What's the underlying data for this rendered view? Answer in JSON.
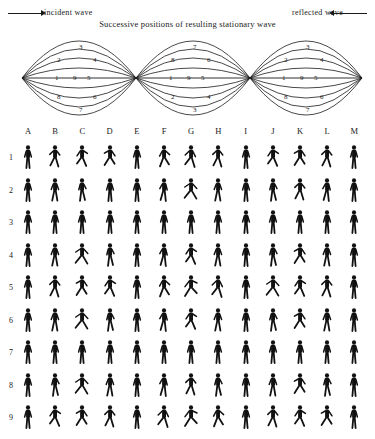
{
  "header": {
    "incident_label": "incident wave",
    "reflected_label": "reflected wave",
    "caption": "Successive positions of resulting stationary wave"
  },
  "wave_diagram": {
    "nodes_x": [
      22,
      136,
      250,
      362
    ],
    "axis_y": 48,
    "lobes": [
      {
        "index": 0,
        "orientation": "up",
        "labels": {
          "top": "3",
          "upper_left": "2",
          "upper_right": "4",
          "mid_left": "1",
          "mid_center": "9",
          "mid_right": "5",
          "lower_left": "8",
          "lower_right": "6",
          "bottom": "7"
        }
      },
      {
        "index": 1,
        "orientation": "down",
        "labels": {
          "top": "7",
          "upper_left": "8",
          "upper_right": "6",
          "mid_left": "1",
          "mid_center": "9",
          "mid_right": "5",
          "lower_left": "2",
          "lower_right": "4",
          "bottom": "3"
        }
      },
      {
        "index": 2,
        "orientation": "up",
        "labels": {
          "top": "3",
          "upper_left": "2",
          "upper_right": "4",
          "mid_left": "1",
          "mid_center": "9",
          "mid_right": "5",
          "lower_left": "8",
          "lower_right": "6",
          "bottom": "7"
        }
      }
    ]
  },
  "grid": {
    "column_labels": [
      "A",
      "B",
      "C",
      "D",
      "E",
      "F",
      "G",
      "H",
      "I",
      "J",
      "K",
      "L",
      "M"
    ],
    "row_labels": [
      "1",
      "2",
      "3",
      "4",
      "5",
      "6",
      "7",
      "8",
      "9"
    ],
    "figure_icon": "running-figure-icon",
    "poses": [
      [
        "stand",
        "run-a",
        "run-b",
        "run-c",
        "stand",
        "run-d",
        "run-e",
        "run-a",
        "stand",
        "run-b",
        "run-c",
        "run-a",
        "stand"
      ],
      [
        "stand",
        "walk-a",
        "walk-b",
        "stand",
        "stand",
        "walk-c",
        "run-f",
        "walk-a",
        "stand",
        "walk-b",
        "run-a",
        "walk-c",
        "stand"
      ],
      [
        "stand",
        "stand",
        "stand",
        "stand",
        "stand",
        "stand",
        "stand",
        "stand",
        "stand",
        "stand",
        "stand",
        "stand",
        "stand"
      ],
      [
        "stand",
        "walk-a",
        "run-f",
        "walk-b",
        "stand",
        "walk-c",
        "run-b",
        "walk-a",
        "stand",
        "walk-b",
        "run-c",
        "walk-a",
        "stand"
      ],
      [
        "stand",
        "run-a",
        "run-c",
        "run-b",
        "stand",
        "run-d",
        "run-g",
        "run-e",
        "stand",
        "run-f",
        "run-b",
        "run-a",
        "stand"
      ],
      [
        "stand",
        "walk-a",
        "run-f",
        "walk-b",
        "stand",
        "walk-c",
        "run-b",
        "walk-a",
        "stand",
        "walk-b",
        "run-c",
        "walk-a",
        "stand"
      ],
      [
        "stand",
        "stand",
        "stand",
        "stand",
        "stand",
        "stand",
        "stand",
        "stand",
        "stand",
        "stand",
        "stand",
        "stand",
        "stand"
      ],
      [
        "stand",
        "walk-b",
        "run-f",
        "walk-a",
        "stand",
        "walk-c",
        "run-a",
        "walk-b",
        "stand",
        "walk-a",
        "run-c",
        "walk-b",
        "stand"
      ],
      [
        "stand",
        "run-b",
        "run-c",
        "run-a",
        "stand",
        "run-e",
        "run-g",
        "run-d",
        "stand",
        "run-a",
        "run-b",
        "run-c",
        "stand"
      ]
    ]
  }
}
